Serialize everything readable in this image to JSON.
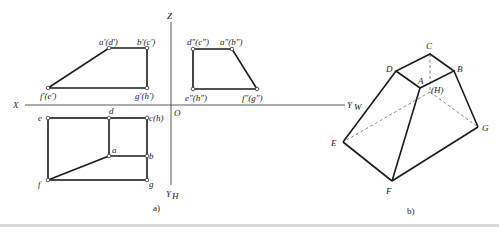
{
  "figure_a": {
    "caption": "a)",
    "axes": {
      "z": "Z",
      "x": "X",
      "yw": "Y",
      "yw_sub": "W",
      "yh": "Y",
      "yh_sub": "H",
      "origin": "O"
    },
    "front_view_labels": {
      "ad": "a'(d')",
      "bc": "b'(c')",
      "fe": "f'(e')",
      "gh": "g'(h')"
    },
    "side_view_labels": {
      "dc": "d\"(c\")",
      "ab": "a\"(b\")",
      "eh": "e\"(h\")",
      "fg": "f\"(g\")"
    },
    "top_view_labels": {
      "e": "e",
      "d": "d",
      "ch": "c(h)",
      "a": "a",
      "b": "b",
      "f": "f",
      "g": "g"
    }
  },
  "figure_b": {
    "caption": "b)",
    "vertex_labels": {
      "A": "A",
      "B": "B",
      "C": "C",
      "D": "D",
      "E": "E",
      "F": "F",
      "G": "G",
      "H": "(H)"
    }
  }
}
